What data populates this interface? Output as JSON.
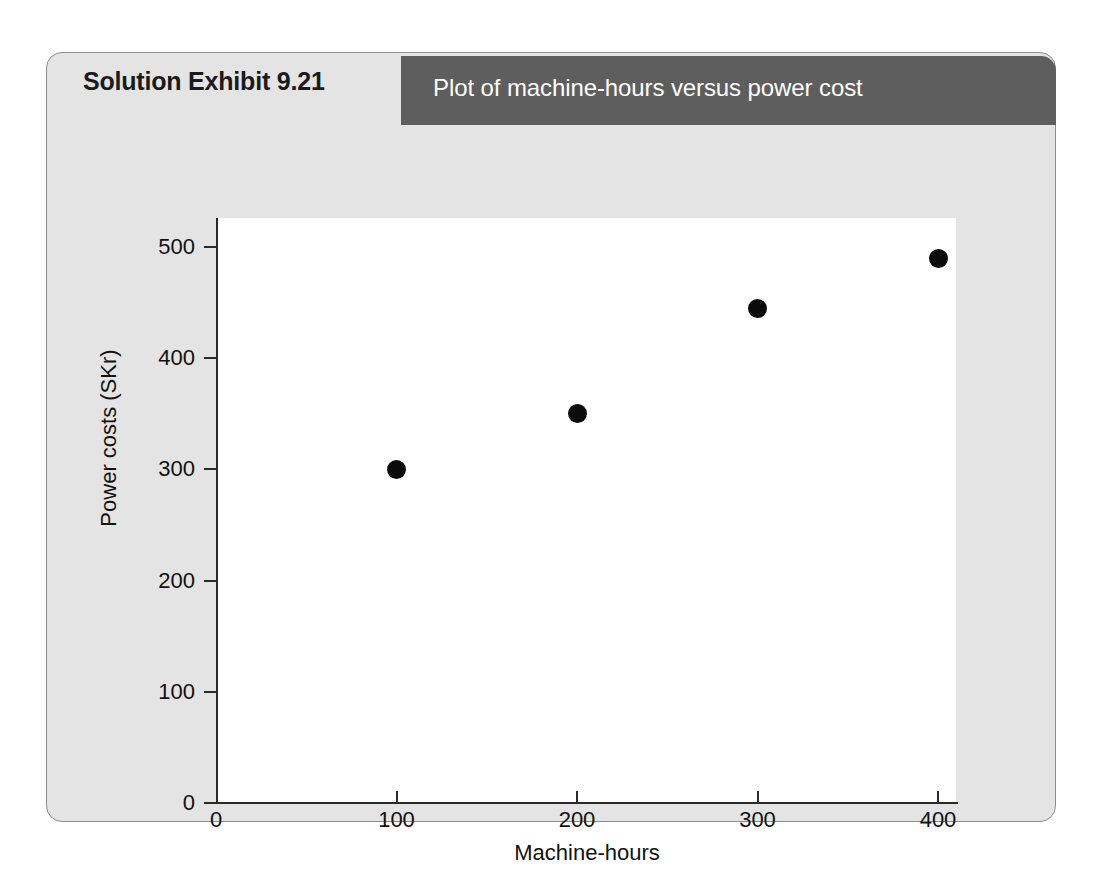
{
  "exhibit": {
    "number_label": "Solution Exhibit 9.21",
    "title": "Plot of machine-hours versus power cost",
    "header_bar_color": "#5e5e5e",
    "panel_color": "#e4e4e4",
    "plot_background": "#ffffff",
    "point_color": "#0b0b0b"
  },
  "chart_data": {
    "type": "scatter",
    "title": "Plot of machine-hours versus power cost",
    "xlabel": "Machine-hours",
    "ylabel": "Power costs (SKr)",
    "xlim": [
      0,
      425
    ],
    "ylim": [
      0,
      527
    ],
    "xticks": [
      0,
      100,
      200,
      300,
      400
    ],
    "xtick_labels": [
      "0",
      "100",
      "200",
      "300",
      "400"
    ],
    "yticks": [
      0,
      100,
      200,
      300,
      400,
      500
    ],
    "ytick_labels": [
      "0",
      "100",
      "200",
      "300",
      "400",
      "500"
    ],
    "grid": false,
    "legend": null,
    "series": [
      {
        "name": "Power cost observations",
        "points": [
          {
            "x": 100,
            "y": 300
          },
          {
            "x": 200,
            "y": 350
          },
          {
            "x": 300,
            "y": 445
          },
          {
            "x": 400,
            "y": 490
          }
        ]
      }
    ]
  }
}
